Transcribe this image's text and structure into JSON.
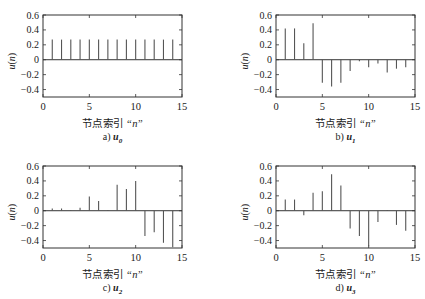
{
  "chart_data": [
    {
      "type": "stem",
      "panel_label": "a)",
      "title_symbol": "u",
      "title_subscript": "0",
      "xlabel_cn": "节点索引",
      "xlabel_var": "n",
      "ylabel": "u(n)",
      "xlim": [
        0,
        15
      ],
      "ylim": [
        -0.5,
        0.6
      ],
      "xticks": [
        0,
        5,
        10,
        15
      ],
      "yticks": [
        0.6,
        0.4,
        0.2,
        0,
        -0.2,
        -0.4
      ],
      "x": [
        1,
        2,
        3,
        4,
        5,
        6,
        7,
        8,
        9,
        10,
        11,
        12,
        13,
        14
      ],
      "values": [
        0.27,
        0.27,
        0.27,
        0.27,
        0.27,
        0.27,
        0.27,
        0.27,
        0.27,
        0.27,
        0.27,
        0.27,
        0.27,
        0.27
      ]
    },
    {
      "type": "stem",
      "panel_label": "b)",
      "title_symbol": "u",
      "title_subscript": "1",
      "xlabel_cn": "节点索引",
      "xlabel_var": "n",
      "ylabel": "u(n)",
      "xlim": [
        0,
        15
      ],
      "ylim": [
        -0.5,
        0.6
      ],
      "xticks": [
        0,
        5,
        10,
        15
      ],
      "yticks": [
        0.6,
        0.4,
        0.2,
        0,
        -0.2,
        -0.4
      ],
      "x": [
        1,
        2,
        3,
        4,
        5,
        6,
        7,
        8,
        9,
        10,
        11,
        12,
        13,
        14
      ],
      "values": [
        0.42,
        0.42,
        0.22,
        0.49,
        -0.31,
        -0.36,
        -0.31,
        -0.15,
        -0.02,
        -0.1,
        -0.05,
        -0.17,
        -0.12,
        -0.1
      ]
    },
    {
      "type": "stem",
      "panel_label": "c)",
      "title_symbol": "u",
      "title_subscript": "2",
      "xlabel_cn": "节点索引",
      "xlabel_var": "n",
      "ylabel": "u(n)",
      "xlim": [
        0,
        15
      ],
      "ylim": [
        -0.5,
        0.6
      ],
      "xticks": [
        0,
        5,
        10,
        15
      ],
      "yticks": [
        0.6,
        0.4,
        0.2,
        0,
        -0.2,
        -0.4
      ],
      "x": [
        1,
        2,
        3,
        4,
        5,
        6,
        7,
        8,
        9,
        10,
        11,
        12,
        13,
        14
      ],
      "values": [
        0.03,
        0.03,
        0.01,
        0.04,
        0.19,
        0.13,
        0.01,
        0.35,
        0.29,
        0.4,
        -0.34,
        -0.29,
        -0.43,
        -0.49
      ]
    },
    {
      "type": "stem",
      "panel_label": "d)",
      "title_symbol": "u",
      "title_subscript": "3",
      "xlabel_cn": "节点索引",
      "xlabel_var": "n",
      "ylabel": "u(n)",
      "xlim": [
        0,
        15
      ],
      "ylim": [
        -0.5,
        0.6
      ],
      "xticks": [
        0,
        5,
        10,
        15
      ],
      "yticks": [
        0.6,
        0.4,
        0.2,
        0,
        -0.2,
        -0.4
      ],
      "x": [
        1,
        2,
        3,
        4,
        5,
        6,
        7,
        8,
        9,
        10,
        11,
        12,
        13,
        14
      ],
      "values": [
        0.15,
        0.15,
        -0.06,
        0.24,
        0.26,
        0.49,
        0.34,
        -0.24,
        -0.34,
        -0.48,
        -0.15,
        0.01,
        -0.19,
        -0.27
      ]
    }
  ],
  "colors": {
    "axis": "#333333",
    "stem": "#555555",
    "text": "#222222"
  }
}
